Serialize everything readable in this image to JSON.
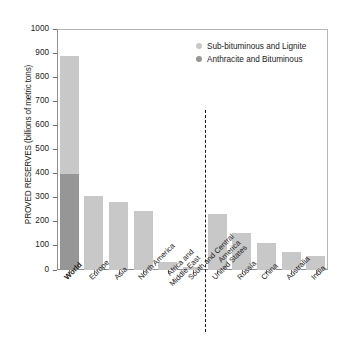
{
  "chart_data": {
    "type": "bar",
    "title": "",
    "subtitle": "",
    "xlabel": "",
    "ylabel": "PROVED RESERVES (billions of metric tons)",
    "ylim": [
      0,
      1000
    ],
    "ytick_labels": [
      "1000",
      "900",
      "800",
      "700",
      "600",
      "500",
      "400",
      "300",
      "200",
      "100",
      "0"
    ],
    "ytick_values": [
      1000,
      900,
      800,
      700,
      600,
      500,
      400,
      300,
      200,
      100,
      0
    ],
    "grid": false,
    "legend_position": "top-right",
    "stacked": true,
    "categories": [
      "World",
      "Europe",
      "Asia",
      "North America",
      "Africa and\nMiddle East",
      "South and Central\nAmerica",
      "United States",
      "Russia",
      "China",
      "Australia",
      "India"
    ],
    "series": [
      {
        "name": "Anthracite and Bituminous",
        "color": "#969696",
        "values": [
          398,
          0,
          0,
          0,
          0,
          0,
          0,
          0,
          0,
          0,
          0
        ]
      },
      {
        "name": "Sub-bituminous and Lignite",
        "color": "#c8c8c8",
        "values": [
          492,
          307,
          283,
          243,
          34,
          13,
          234,
          152,
          111,
          73,
          58
        ]
      }
    ],
    "totals": [
      890,
      307,
      283,
      243,
      34,
      13,
      234,
      152,
      111,
      73,
      58
    ],
    "annotations": [
      {
        "name": "group-divider",
        "type": "dashed-vertical-line",
        "between": [
          "South and Central America",
          "United States"
        ]
      }
    ]
  },
  "legend": {
    "items": [
      {
        "label": "Sub-bituminous and Lignite",
        "color": "#c8c8c8"
      },
      {
        "label": "Anthracite and Bituminous",
        "color": "#969696"
      }
    ]
  },
  "colors": {
    "light_gray_bar": "#c8c8c8",
    "dark_gray_bar": "#969696",
    "axis": "#8f8f8f",
    "text": "#1a1a1a",
    "frame": "#b6b6b6"
  }
}
